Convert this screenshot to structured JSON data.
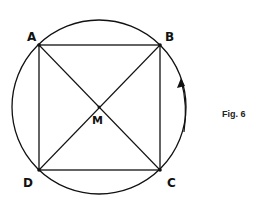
{
  "diagram": {
    "caption": "Fig. 6",
    "labels": {
      "A": "A",
      "B": "B",
      "C": "C",
      "D": "D",
      "M": "M"
    },
    "colors": {
      "stroke": "#111111",
      "background": "#ffffff"
    }
  }
}
